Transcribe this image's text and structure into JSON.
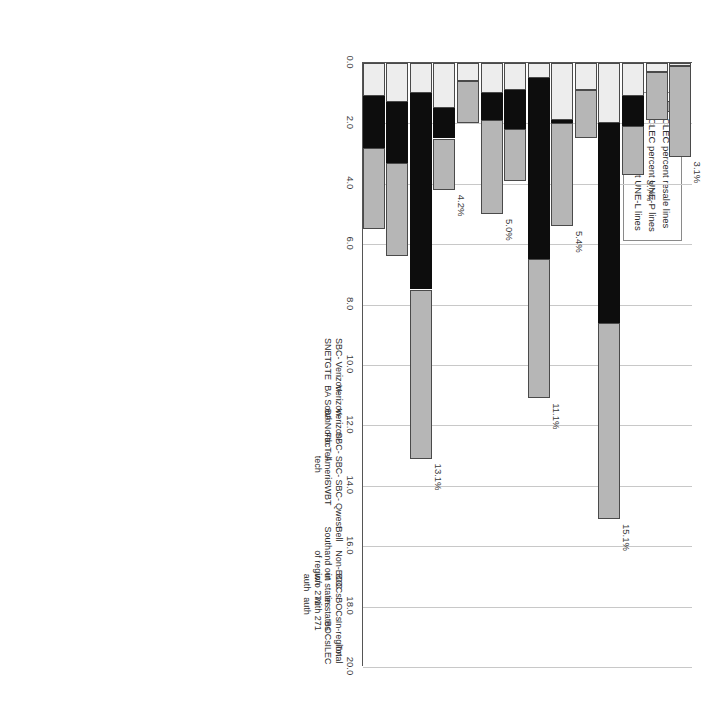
{
  "chart_data": {
    "type": "bar",
    "orientation": "horizontal",
    "title": "",
    "xlabel": "",
    "ylabel": "",
    "xlim": [
      0.0,
      20.0
    ],
    "xticks": [
      "0.0",
      "2.0",
      "4.0",
      "6.0",
      "8.0",
      "10.0",
      "12.0",
      "14.0",
      "16.0",
      "18.0",
      "20.0"
    ],
    "xtick_values": [
      0.0,
      2.0,
      4.0,
      6.0,
      8.0,
      10.0,
      12.0,
      14.0,
      16.0,
      18.0,
      20.0
    ],
    "grid": true,
    "legend_position": "top-left",
    "legend": [
      "CLEC percent resale lines",
      "CLEC percent UNE-P lines",
      "CLEC percent UNE-L lines"
    ],
    "categories": [
      "Total ILEC",
      "In-region BOCs",
      "BOCs in states with 271 auth",
      "BOCs in states w/o 271 auth",
      "Non-BOC and out of region",
      "Bell South",
      "Qwest",
      "SBC-SWBT",
      "SBC-Ameritech",
      "SBC-FacTell",
      "Verizon-BA North",
      "Verizon-BA South",
      "Verizon-GTE",
      "SBC-SNET"
    ],
    "category_lines": [
      [
        "Total",
        "ILEC"
      ],
      [
        "In-region",
        "BOCs"
      ],
      [
        "BOCs",
        "in states",
        "with 271",
        "auth"
      ],
      [
        "BOCs",
        "in states",
        "w/o 271",
        "auth"
      ],
      [
        "Non-BOC",
        "and out",
        "of region"
      ],
      [
        "Bell",
        "South"
      ],
      [
        "Qwest"
      ],
      [
        "SBC-",
        "SWBT"
      ],
      [
        "SBC-",
        "Ameri-",
        "tech"
      ],
      [
        "SBC-",
        "FacTell"
      ],
      [
        "Verizon-",
        "BA North"
      ],
      [
        "Verizon-",
        "BA South"
      ],
      [
        "Verizon-",
        "GTE"
      ],
      [
        "SBC-",
        "SNET"
      ]
    ],
    "series": [
      {
        "name": "CLEC percent UNE-L lines",
        "key": "unel",
        "color": "#ededed",
        "values": [
          1.1,
          1.3,
          1.0,
          1.5,
          0.6,
          1.0,
          0.9,
          0.5,
          1.9,
          0.9,
          2.0,
          1.1,
          0.3,
          0.1
        ]
      },
      {
        "name": "CLEC percent UNE-P lines",
        "key": "unep",
        "color": "#0d0d0d",
        "values": [
          1.7,
          2.0,
          6.5,
          1.0,
          0.0,
          0.9,
          1.3,
          6.0,
          0.1,
          0.0,
          6.6,
          1.0,
          0.0,
          0.0
        ]
      },
      {
        "name": "CLEC percent resale lines",
        "key": "resale",
        "color": "#b6b6b6",
        "values": [
          2.7,
          3.1,
          5.6,
          1.7,
          1.4,
          3.1,
          1.7,
          4.6,
          3.4,
          1.6,
          6.5,
          1.6,
          1.6,
          3.0
        ]
      }
    ],
    "totals": [
      5.5,
      6.4,
      13.1,
      4.2,
      2.0,
      5.0,
      3.9,
      11.1,
      5.4,
      2.5,
      15.1,
      3.7,
      1.9,
      3.1
    ],
    "total_labels": [
      "5.5%",
      "6.4%",
      "13.1%",
      "4.2%",
      "2.0%",
      "5.0%",
      "3.9%",
      "11.1%",
      "5.4%",
      "2.5%",
      "15.1%",
      "3.7%",
      "1.9%",
      "3.1%"
    ]
  }
}
